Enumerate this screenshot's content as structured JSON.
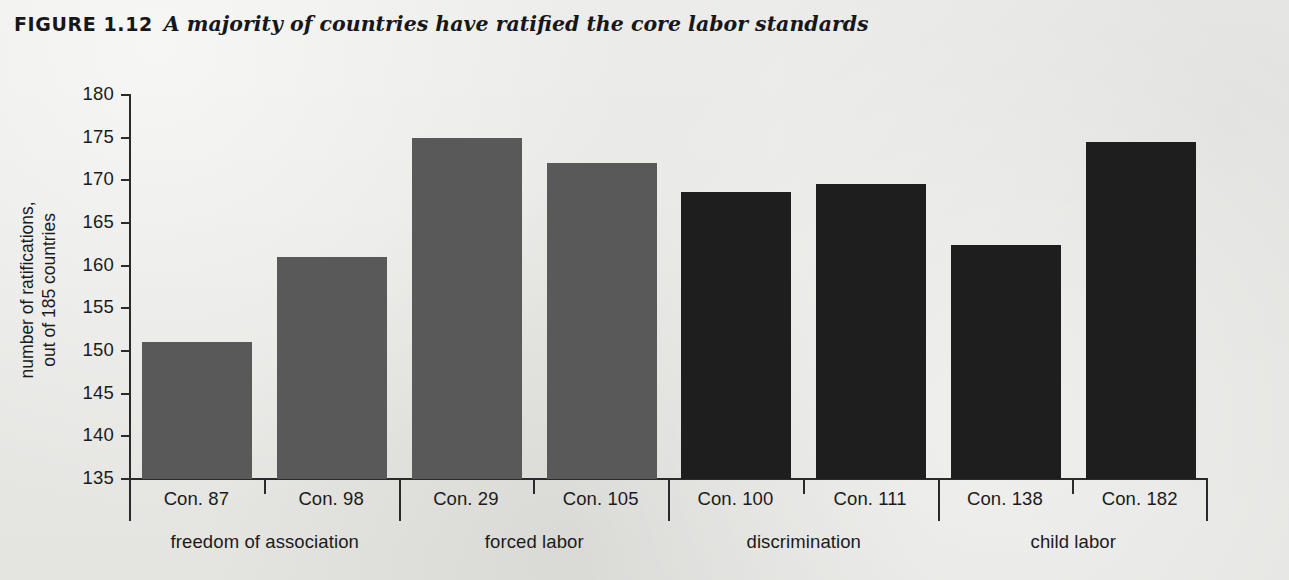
{
  "figure": {
    "label": "FIGURE 1.12",
    "caption": "A majority of countries have ratified the core labor standards"
  },
  "chart_data": {
    "type": "bar",
    "title": "A majority of countries have ratified the core labor standards",
    "xlabel": "",
    "ylabel": "number of ratifications, out of 185 countries",
    "ylabel_lines": [
      "number of ratifications,",
      "out of 185 countries"
    ],
    "ylim": [
      135,
      180
    ],
    "yticks": [
      135,
      140,
      145,
      150,
      155,
      160,
      165,
      170,
      175,
      180
    ],
    "ytick_labels": [
      "135",
      "140",
      "145",
      "150",
      "155",
      "160",
      "165",
      "170",
      "175",
      "180"
    ],
    "grid": false,
    "legend": "none",
    "categories": [
      "Con. 87",
      "Con. 98",
      "Con. 29",
      "Con. 105",
      "Con. 100",
      "Con. 111",
      "Con. 138",
      "Con. 182"
    ],
    "values": [
      151,
      161,
      175,
      172,
      168.6,
      169.6,
      162.4,
      174.5
    ],
    "bar_colors": [
      "#595959",
      "#595959",
      "#595959",
      "#595959",
      "#1e1e1e",
      "#1e1e1e",
      "#1e1e1e",
      "#1e1e1e"
    ],
    "groups": [
      {
        "label": "freedom of association",
        "categories": [
          "Con. 87",
          "Con. 98"
        ],
        "color": "#595959"
      },
      {
        "label": "forced labor",
        "categories": [
          "Con. 29",
          "Con. 105"
        ],
        "color": "#595959"
      },
      {
        "label": "discrimination",
        "categories": [
          "Con. 100",
          "Con. 111"
        ],
        "color": "#1e1e1e"
      },
      {
        "label": "child labor",
        "categories": [
          "Con. 138",
          "Con. 182"
        ],
        "color": "#1e1e1e"
      }
    ],
    "colors": {
      "background": "#e9e9e6",
      "axis": "#2a2a2a",
      "text": "#1b1b1b",
      "bar_light": "#595959",
      "bar_dark": "#1e1e1e"
    }
  }
}
